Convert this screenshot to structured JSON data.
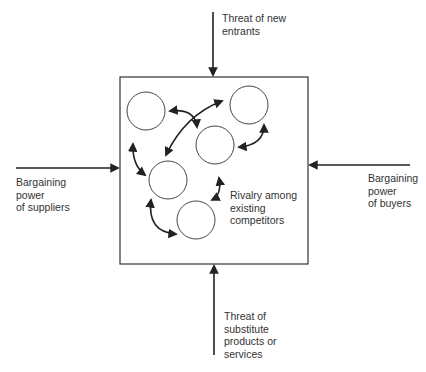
{
  "diagram": {
    "forces": {
      "top": "Threat of new\nentrants",
      "left": "Bargaining\npower\nof suppliers",
      "right": "Bargaining\npower\nof buyers",
      "bottom": "Threat of\nsubstitute\nproducts or\nservices",
      "center": "Rivalry among\nexisting\ncompetitors"
    },
    "competitor_count": 5,
    "colors": {
      "line": "#222222",
      "text": "#333333",
      "background": "#ffffff"
    }
  }
}
